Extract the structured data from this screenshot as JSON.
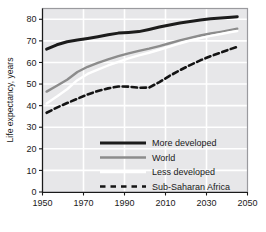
{
  "chart_data": {
    "type": "line",
    "title": "",
    "xlabel": "",
    "ylabel": "Life expectancy, years",
    "xlim": [
      1950,
      2050
    ],
    "ylim": [
      0,
      85
    ],
    "xticks": [
      1950,
      1970,
      1990,
      2010,
      2030,
      2050
    ],
    "yticks": [
      0,
      10,
      20,
      30,
      40,
      50,
      60,
      70,
      80
    ],
    "grid": true,
    "grid_color": "#ffffff",
    "plot_background": "#e7e7e9",
    "legend_position": "inside-lower-center",
    "x": [
      1952,
      1957,
      1962,
      1967,
      1972,
      1977,
      1982,
      1987,
      1992,
      1997,
      2002,
      2007,
      2012,
      2017,
      2022,
      2027,
      2032,
      2037,
      2042,
      2045
    ],
    "series": [
      {
        "name": "More developed",
        "color": "#1c1c1c",
        "style": "solid",
        "width": 3.0,
        "values": [
          66.2,
          68.2,
          69.6,
          70.4,
          71.1,
          71.9,
          72.8,
          73.6,
          73.9,
          74.3,
          75.3,
          76.4,
          77.4,
          78.3,
          79.0,
          79.7,
          80.2,
          80.6,
          81.0,
          81.2
        ]
      },
      {
        "name": "World",
        "color": "#8c8c8c",
        "style": "solid",
        "width": 2.4,
        "values": [
          46.5,
          49.2,
          52.0,
          55.6,
          58.0,
          59.8,
          61.4,
          62.9,
          64.2,
          65.4,
          66.4,
          67.6,
          68.9,
          70.2,
          71.4,
          72.5,
          73.4,
          74.2,
          75.1,
          75.6
        ]
      },
      {
        "name": "Less developed",
        "color": "#ffffff",
        "style": "solid",
        "width": 2.4,
        "values": [
          41.0,
          44.2,
          47.6,
          51.8,
          54.7,
          56.7,
          58.6,
          60.3,
          61.9,
          63.3,
          64.5,
          65.9,
          67.3,
          68.8,
          70.1,
          71.3,
          72.3,
          73.2,
          74.1,
          74.6
        ]
      },
      {
        "name": "Sub-Saharan Africa",
        "color": "#141414",
        "style": "dashed",
        "width": 2.6,
        "values": [
          36.7,
          39.1,
          41.2,
          43.2,
          45.2,
          46.8,
          48.0,
          48.9,
          48.8,
          48.3,
          48.4,
          50.9,
          53.8,
          56.4,
          58.8,
          61.0,
          62.9,
          64.6,
          66.3,
          67.2
        ]
      }
    ],
    "legend": [
      {
        "label": "More developed",
        "color": "#1c1c1c",
        "style": "solid",
        "width": 3.0
      },
      {
        "label": "World",
        "color": "#8c8c8c",
        "style": "solid",
        "width": 2.4
      },
      {
        "label": "Less developed",
        "color": "#ffffff",
        "style": "solid",
        "width": 2.4
      },
      {
        "label": "Sub-Saharan Africa",
        "color": "#141414",
        "style": "dashed",
        "width": 2.6
      }
    ]
  },
  "axes": {
    "y_title": "Life expectancy, years",
    "y_tick_labels": [
      "80",
      "70",
      "60",
      "50",
      "40",
      "30",
      "20",
      "10",
      "0"
    ],
    "x_tick_labels": [
      "1950",
      "1970",
      "1990",
      "2010",
      "2030",
      "2050"
    ]
  },
  "legend_labels": {
    "more_developed": "More developed",
    "world": "World",
    "less_developed": "Less developed",
    "sub_saharan_africa": "Sub-Saharan Africa"
  }
}
